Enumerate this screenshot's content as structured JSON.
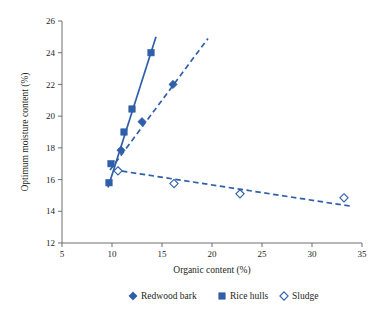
{
  "chart_data": {
    "type": "scatter",
    "title": "",
    "xlabel": "Organic content (%)",
    "ylabel": "Optimum moisture content (%)",
    "xlim": [
      5,
      35
    ],
    "ylim": [
      12,
      26
    ],
    "xticks": [
      5,
      10,
      15,
      20,
      25,
      30,
      35
    ],
    "yticks": [
      12,
      14,
      16,
      18,
      20,
      22,
      24,
      26
    ],
    "xtick_labels": [
      "5",
      "10",
      "15",
      "20",
      "25",
      "30",
      "35"
    ],
    "ytick_labels": [
      "12",
      "14",
      "16",
      "18",
      "20",
      "22",
      "24",
      "26"
    ],
    "grid": false,
    "legend_position": "bottom",
    "accent_color": "#2f5fa8",
    "axis_color": "#6f6f6f",
    "text_color": "#231f20",
    "series": [
      {
        "name": "Redwood bark",
        "marker": "filled-diamond",
        "color": "#2f5fa8",
        "line_style": "dashed",
        "points": [
          {
            "x": 10.9,
            "y": 17.85
          },
          {
            "x": 13.0,
            "y": 19.65
          },
          {
            "x": 16.1,
            "y": 22.0
          }
        ],
        "trend_line": {
          "x1": 9.8,
          "y1": 16.6,
          "x2": 19.6,
          "y2": 24.9
        }
      },
      {
        "name": "Rice hulls",
        "marker": "filled-square",
        "color": "#2f5fa8",
        "line_style": "solid",
        "points": [
          {
            "x": 9.7,
            "y": 15.8
          },
          {
            "x": 9.9,
            "y": 17.0
          },
          {
            "x": 11.2,
            "y": 19.0
          },
          {
            "x": 12.0,
            "y": 20.45
          },
          {
            "x": 13.9,
            "y": 24.0
          }
        ],
        "trend_line": {
          "x1": 9.6,
          "y1": 15.5,
          "x2": 14.4,
          "y2": 25.0
        }
      },
      {
        "name": "Sludge",
        "marker": "open-diamond",
        "color": "#2f5fa8",
        "line_style": "dashed",
        "points": [
          {
            "x": 10.6,
            "y": 16.55
          },
          {
            "x": 16.2,
            "y": 15.75
          },
          {
            "x": 22.8,
            "y": 15.1
          },
          {
            "x": 33.2,
            "y": 14.85
          }
        ],
        "trend_line": {
          "x1": 10.1,
          "y1": 16.62,
          "x2": 34.1,
          "y2": 14.3
        }
      }
    ]
  },
  "legend": {
    "items": [
      {
        "label": "Redwood bark",
        "marker": "filled-diamond"
      },
      {
        "label": "Rice hulls",
        "marker": "filled-square"
      },
      {
        "label": "Sludge",
        "marker": "open-diamond"
      }
    ]
  }
}
